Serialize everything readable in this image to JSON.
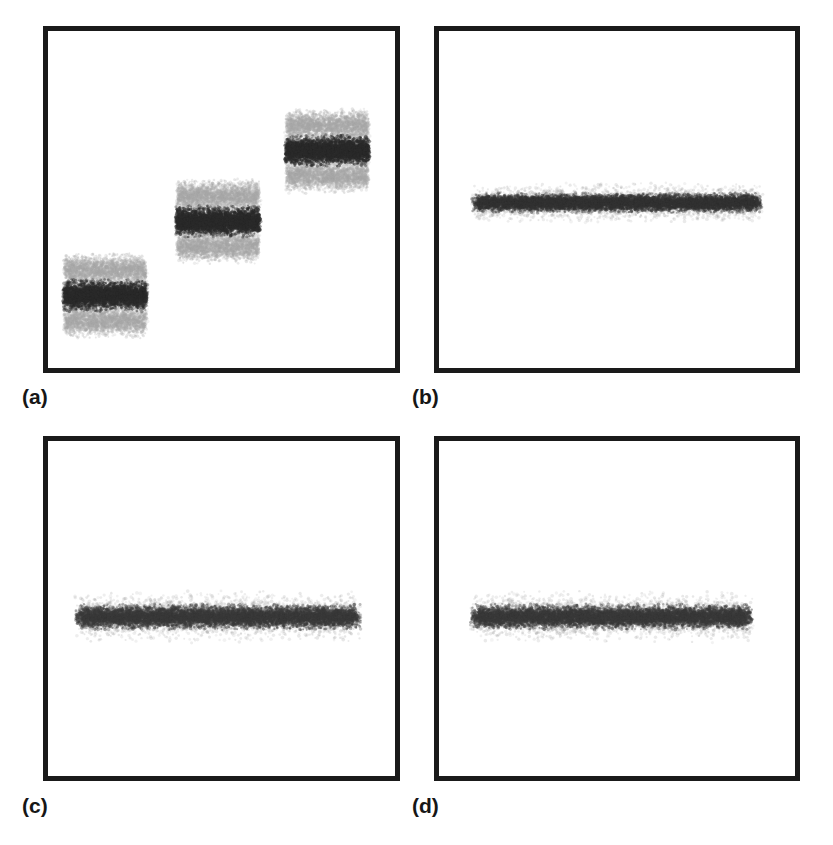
{
  "figure": {
    "background_color": "#ffffff",
    "border_color": "#1a1a1a",
    "panel_count": 4,
    "layout": "2x2 grid"
  },
  "labels": {
    "a": "(a)",
    "b": "(b)",
    "c": "(c)",
    "d": "(d)"
  },
  "chart_data": [
    {
      "type": "scatter",
      "panel": "(a)",
      "title": "",
      "xlabel": "",
      "ylabel": "",
      "xlim": [
        0,
        100
      ],
      "ylim": [
        0,
        100
      ],
      "grid": false,
      "legend": null,
      "description": "Three diagonally ascending dense point clusters, each formed of a dark core band with lighter gray satellite bands above and below separated by white gaps.",
      "clusters": [
        {
          "name": "cluster-1",
          "x_center": 16.5,
          "y_center": 21.5,
          "x_halfwidth": 12.5,
          "core_color": "#2b2b2b",
          "halo_color": "#a8a8a8",
          "core_halfheight": 3.2,
          "band_offset": 7.6,
          "band_halfheight": 3.4
        },
        {
          "name": "cluster-2",
          "x_center": 49.0,
          "y_center": 43.5,
          "x_halfwidth": 12.5,
          "core_color": "#2b2b2b",
          "halo_color": "#a8a8a8",
          "core_halfheight": 3.2,
          "band_offset": 7.6,
          "band_halfheight": 3.4
        },
        {
          "name": "cluster-3",
          "x_center": 80.5,
          "y_center": 64.5,
          "x_halfwidth": 12.5,
          "core_color": "#2b2b2b",
          "halo_color": "#a8a8a8",
          "core_halfheight": 3.2,
          "band_offset": 7.6,
          "band_halfheight": 3.4
        }
      ]
    },
    {
      "type": "scatter",
      "panel": "(b)",
      "title": "",
      "xlabel": "",
      "ylabel": "",
      "xlim": [
        0,
        100
      ],
      "ylim": [
        0,
        100
      ],
      "grid": false,
      "legend": null,
      "description": "A single thin horizontal dense band of points centered vertically, spanning most of the panel width.",
      "clusters": [
        {
          "name": "cluster-merged",
          "x_center": 50.0,
          "y_center": 49.0,
          "x_halfwidth": 41.0,
          "core_color": "#333333",
          "halo_color": "#9a9a9a",
          "core_halfheight": 2.0,
          "band_offset": 0,
          "band_halfheight": 0
        }
      ]
    },
    {
      "type": "scatter",
      "panel": "(c)",
      "title": "",
      "xlabel": "",
      "ylabel": "",
      "xlim": [
        0,
        100
      ],
      "ylim": [
        0,
        100
      ],
      "grid": false,
      "legend": null,
      "description": "A single horizontal dense band of points centered vertically, slightly thicker than panel (b).",
      "clusters": [
        {
          "name": "cluster-merged",
          "x_center": 49.0,
          "y_center": 47.5,
          "x_halfwidth": 41.5,
          "core_color": "#3a3a3a",
          "halo_color": "#9a9a9a",
          "core_halfheight": 2.6,
          "band_offset": 0,
          "band_halfheight": 0
        }
      ]
    },
    {
      "type": "scatter",
      "panel": "(d)",
      "title": "",
      "xlabel": "",
      "ylabel": "",
      "xlim": [
        0,
        100
      ],
      "ylim": [
        0,
        100
      ],
      "grid": false,
      "legend": null,
      "description": "A single horizontal dense band of points centered vertically, similar thickness to panel (c) and marginally shorter.",
      "clusters": [
        {
          "name": "cluster-merged",
          "x_center": 48.5,
          "y_center": 47.5,
          "x_halfwidth": 40.0,
          "core_color": "#3a3a3a",
          "halo_color": "#9a9a9a",
          "core_halfheight": 2.6,
          "band_offset": 0,
          "band_halfheight": 0
        }
      ]
    }
  ]
}
